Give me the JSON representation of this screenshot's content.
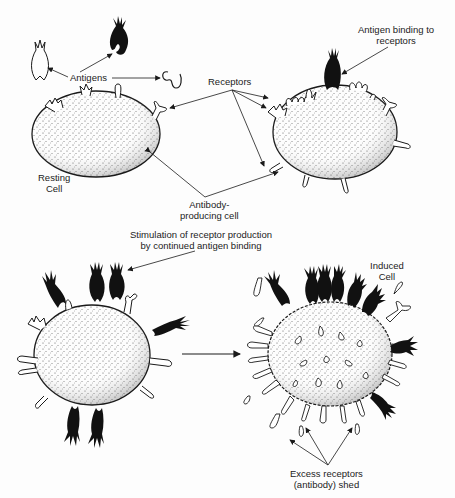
{
  "diagram": {
    "type": "biological-process-illustration",
    "panels": [
      {
        "id": "top",
        "cells": [
          "resting-cell",
          "antibody-producing-cell"
        ]
      },
      {
        "id": "bottom",
        "cells": [
          "stimulated-cell",
          "induced-cell"
        ]
      }
    ],
    "colors": {
      "ink": "#1a1a1a",
      "background": "#fdfdfd",
      "stipple": "#555555"
    }
  },
  "labels": {
    "antigens": "Antigens",
    "receptors": "Receptors",
    "antigen_binding_line1": "Antigen binding to",
    "antigen_binding_line2": "receptors",
    "resting_line1": "Resting",
    "resting_line2": "Cell",
    "antibody_line1": "Antibody-",
    "antibody_line2": "producing cell",
    "stimulation_line1": "Stimulation of receptor production",
    "stimulation_line2": "by continued antigen binding",
    "induced_line1": "Induced",
    "induced_line2": "Cell",
    "excess_line1": "Excess receptors",
    "excess_line2": "(antibody) shed"
  }
}
